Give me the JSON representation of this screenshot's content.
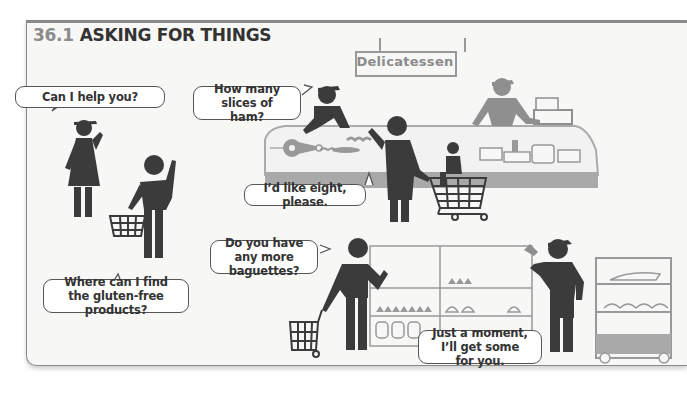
{
  "header": {
    "section_number": "36.1",
    "title": "ASKING FOR THINGS"
  },
  "scene": {
    "sign": "Delicatessen",
    "bubbles": {
      "assistant_offer": "Can I help you?",
      "deli_question": "How many slices of ham?",
      "customer_answer": "I’d like eight, please.",
      "gluten_question": "Where can I find the gluten-free products?",
      "baguette_question": "Do you have any more baguettes?",
      "baker_answer": "Just a moment, I’ll get some for you."
    }
  },
  "colors": {
    "figure_dark": "#3b3b3b",
    "figure_gray": "#8f8f8f",
    "counter_gray": "#a9a9a9",
    "frame_bg": "#f7f7f6",
    "frame_border": "#8a8a8a"
  }
}
